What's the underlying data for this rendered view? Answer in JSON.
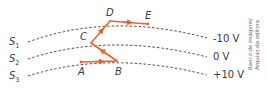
{
  "diagram": {
    "surfaces": [
      {
        "label": "S",
        "sub": "1",
        "potential": "-10 V"
      },
      {
        "label": "S",
        "sub": "2",
        "potential": "0 V"
      },
      {
        "label": "S",
        "sub": "3",
        "potential": "+10 V"
      }
    ],
    "points": {
      "A": "A",
      "B": "B",
      "C": "C",
      "D": "D",
      "E": "E"
    },
    "path_color": "#e8622a",
    "credit": {
      "line1": "Banco de imagens/",
      "line2": "Arquivo da editora"
    }
  }
}
